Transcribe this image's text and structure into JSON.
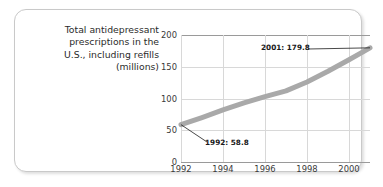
{
  "caption": {
    "line1": "Total antidepressant",
    "line2": "prescriptions in the",
    "line3": "U.S., including refills",
    "line4": "(millions)"
  },
  "annotations": {
    "start_label": "1992: 58.8",
    "end_label": "2001: 179.8"
  },
  "colors": {
    "series_line": "#a9a9a9",
    "gridline": "#d8d8d8",
    "axis": "#9a9a9a",
    "card_border": "#c9c9c9",
    "text": "#2b2b2b"
  },
  "chart_data": {
    "type": "line",
    "title": "Total antidepressant prescriptions in the U.S., including refills (millions)",
    "xlabel": "",
    "ylabel": "",
    "x": [
      1992,
      1993,
      1994,
      1995,
      1996,
      1997,
      1998,
      1999,
      2000,
      2001
    ],
    "values": [
      58.8,
      70.0,
      82.0,
      93.0,
      103.0,
      112.0,
      126.0,
      143.0,
      161.0,
      179.8
    ],
    "xlim": [
      1992,
      2001
    ],
    "ylim": [
      0,
      200
    ],
    "yticks": [
      0,
      50,
      100,
      150,
      200
    ],
    "ytick_labels": [
      "0",
      "50",
      "100",
      "150",
      "200"
    ],
    "xticks": [
      1992,
      1994,
      1996,
      1998,
      2000
    ],
    "xtick_labels": [
      "1992",
      "1994",
      "1996",
      "1998",
      "2000"
    ],
    "grid": true,
    "legend": "none",
    "annotations": [
      {
        "label": "1992: 58.8",
        "x": 1992,
        "y": 58.8
      },
      {
        "label": "2001: 179.8",
        "x": 2001,
        "y": 179.8
      }
    ]
  }
}
